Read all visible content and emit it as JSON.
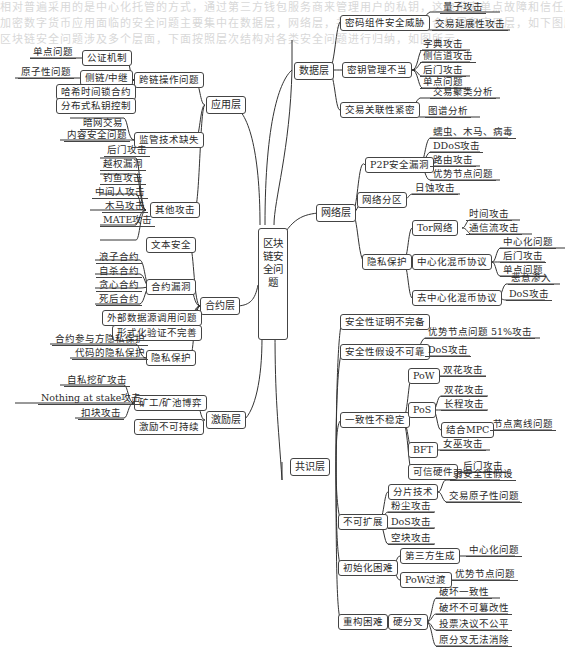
{
  "background_text": [
    "相对普遍采用的是中心化托管的方式，通过第三方钱包服务商来管理用户的私钥，这也带来单点故障和信任风险。",
    "加密数字货币应用面临的安全问题主要集中在数据层，网络层，共识层，激励层，合约层和应用层，如下图所示，",
    "区块链安全问题涉及多个层面，下面按照层次结构对各类安全问题进行归纳，如图所示。"
  ],
  "root": {
    "label": "区块链安全问题"
  },
  "layers": {
    "data": {
      "label": "数据层",
      "children": [
        {
          "label": "密码组件安全威胁",
          "leaves": [
            "量子攻击",
            "交易延展性攻击"
          ]
        },
        {
          "label": "密钥管理不当",
          "leaves": [
            "字典攻击",
            "侧信道攻击",
            "后门攻击",
            "单点问题"
          ]
        },
        {
          "label": "交易关联性紧密",
          "leaves": [
            "交易聚类分析",
            "图谱分析"
          ]
        }
      ]
    },
    "network": {
      "label": "网络层",
      "children": [
        {
          "label": "P2P安全漏洞",
          "leaves": [
            "蠕虫、木马、病毒",
            "DDoS攻击",
            "路由攻击",
            "优势节点问题"
          ]
        },
        {
          "label": "网络分区",
          "leaves": [
            "日蚀攻击"
          ]
        },
        {
          "label": "隐私保护",
          "children": [
            {
              "label": "Tor网络",
              "leaves": [
                "时间攻击",
                "通信流攻击"
              ]
            },
            {
              "label": "中心化混币协议",
              "leaves": [
                "中心化问题",
                "后门攻击",
                "单点问题"
              ]
            },
            {
              "label": "去中心化混币协议",
              "leaves": [
                "恶意渗入",
                "DoS攻击"
              ]
            }
          ]
        }
      ]
    },
    "consensus": {
      "label": "共识层",
      "children": [
        {
          "label": "安全性证明不完备"
        },
        {
          "label": "安全性假设不可靠",
          "leaves": [
            "优势节点问题",
            "DoS攻击"
          ],
          "extra": "51%攻击"
        },
        {
          "label": "一致性不稳定",
          "children": [
            {
              "label": "PoW",
              "leaves": [
                "双花攻击"
              ]
            },
            {
              "label": "PoS",
              "leaves": [
                "双花攻击",
                "长程攻击"
              ],
              "sub": {
                "label": "结合MPC",
                "leaves": [
                  "节点离线问题"
                ]
              }
            },
            {
              "label": "BFT",
              "leaves": [
                "女巫攻击"
              ]
            },
            {
              "label": "可信硬件",
              "leaves": [
                "后门攻击"
              ]
            }
          ]
        },
        {
          "label": "不可扩展",
          "children": [
            {
              "label": "分片技术",
              "leaves": [
                "弱安全性假设",
                "交易原子性问题"
              ]
            }
          ],
          "leaves": [
            "粉尘攻击",
            "DoS攻击",
            "空块攻击"
          ]
        },
        {
          "label": "初始化困难",
          "children": [
            {
              "label": "第三方生成",
              "leaves": [
                "中心化问题"
              ]
            },
            {
              "label": "PoW过渡",
              "leaves": [
                "优势节点问题"
              ]
            }
          ]
        },
        {
          "label": "重构困难",
          "children": [
            {
              "label": "硬分叉",
              "leaves": [
                "破坏一致性",
                "破坏不可篡改性",
                "投票决议不公平",
                "原分叉无法消除"
              ]
            }
          ]
        }
      ]
    },
    "application": {
      "label": "应用层",
      "children": [
        {
          "label": "跨链操作问题",
          "children": [
            {
              "label": "公证机制",
              "leaves": [
                "单点问题"
              ]
            },
            {
              "label": "侧链/中继",
              "leaves": [
                "原子性问题"
              ]
            },
            {
              "label": "哈希时间锁合约"
            },
            {
              "label": "分布式私钥控制"
            }
          ]
        },
        {
          "label": "监管技术缺失",
          "leaves": [
            "暗网交易",
            "内容安全问题"
          ]
        },
        {
          "label": "其他攻击",
          "leaves": [
            "后门攻击",
            "越权漏洞",
            "钓鱼攻击",
            "中间人攻击",
            "木马攻击",
            "MATE攻击"
          ]
        }
      ]
    },
    "contract": {
      "label": "合约层",
      "children": [
        {
          "label": "文本安全"
        },
        {
          "label": "合约漏洞",
          "leaves": [
            "浪子合约",
            "自杀合约",
            "贪心合约",
            "死后合约"
          ]
        },
        {
          "label": "外部数据源调用问题"
        },
        {
          "label": "形式化验证不完善"
        },
        {
          "label": "隐私保护",
          "leaves": [
            "合约参与方隐私保护",
            "代码的隐私保护"
          ]
        }
      ]
    },
    "incentive": {
      "label": "激励层",
      "children": [
        {
          "label": "矿工/矿池博弈",
          "leaves": [
            "自私挖矿攻击",
            "Nothing at stake攻击",
            "扣块攻击"
          ]
        },
        {
          "label": "激励不可持续"
        }
      ]
    }
  }
}
